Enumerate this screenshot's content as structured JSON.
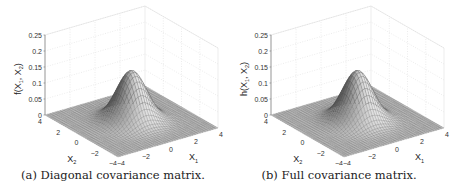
{
  "chart_data": [
    {
      "type": "surface3d",
      "caption": "(a) Diagonal covariance matrix.",
      "zlabel": "f(X1, X2)",
      "xlabel": "X1",
      "ylabel": "X2",
      "z_ticks": [
        "0",
        "0.05",
        "0.1",
        "0.15",
        "0.2",
        "0.25"
      ],
      "zlim": [
        0,
        0.25
      ],
      "x_ticks": [
        "-4",
        "-2",
        "0",
        "2",
        "4"
      ],
      "y_ticks": [
        "-4",
        "-2",
        "0",
        "2",
        "4"
      ],
      "xlim": [
        -4,
        4
      ],
      "ylim": [
        -4,
        4
      ],
      "distribution": "bivariate normal",
      "mean": [
        0,
        0
      ],
      "covariance": [
        [
          1,
          0
        ],
        [
          0,
          1
        ]
      ],
      "peak": 0.159,
      "grid": true,
      "colormap": "gray"
    },
    {
      "type": "surface3d",
      "caption": "(b) Full covariance matrix.",
      "zlabel": "h(X1, X2)",
      "xlabel": "X1",
      "ylabel": "X2",
      "z_ticks": [
        "0",
        "0.05",
        "0.1",
        "0.15",
        "0.2",
        "0.25"
      ],
      "zlim": [
        0,
        0.25
      ],
      "x_ticks": [
        "-4",
        "-2",
        "0",
        "2",
        "4"
      ],
      "y_ticks": [
        "-4",
        "-2",
        "0",
        "2",
        "4"
      ],
      "xlim": [
        -4,
        4
      ],
      "ylim": [
        -4,
        4
      ],
      "distribution": "bivariate normal",
      "mean": [
        0,
        0
      ],
      "covariance": [
        [
          1,
          0
        ],
        [
          0,
          1
        ]
      ],
      "peak": 0.159,
      "grid": true,
      "colormap": "gray"
    }
  ]
}
